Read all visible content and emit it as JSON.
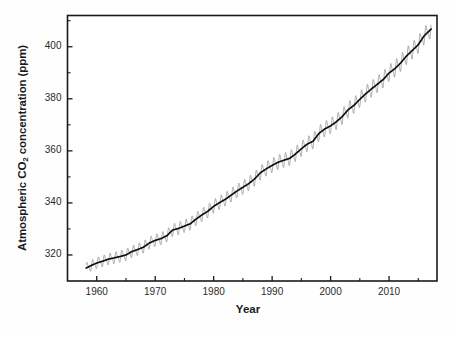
{
  "chart_data": {
    "type": "line",
    "title": "",
    "xlabel": "Year",
    "ylabel": "Atmospheric CO2 concentration (ppm)",
    "ylabel_parts": {
      "pre": "Atmospheric CO",
      "sub": "2",
      "post": " concentration (ppm)"
    },
    "xlim": [
      1955.0,
      2018.2
    ],
    "ylim": [
      310.0,
      412.0
    ],
    "grid": false,
    "legend": null,
    "xticks": [
      1960,
      1970,
      1980,
      1990,
      2000,
      2010
    ],
    "xtick_labels": [
      "1960",
      "1970",
      "1980",
      "1990",
      "2000",
      "2010"
    ],
    "xminor_ticks": [
      1965,
      1975,
      1985,
      1995,
      2005,
      2015
    ],
    "yticks": [
      320,
      340,
      360,
      380,
      400
    ],
    "ytick_labels": [
      "320",
      "340",
      "360",
      "380",
      "400"
    ],
    "yminor_ticks": [
      330,
      350,
      370,
      390,
      410
    ],
    "series": [
      {
        "name": "Annual mean trend",
        "color": "#101010",
        "linewidth": 1.7,
        "x": [
          1958.2,
          1959,
          1960,
          1961,
          1962,
          1963,
          1964,
          1965,
          1966,
          1967,
          1968,
          1969,
          1970,
          1971,
          1972,
          1973,
          1974,
          1975,
          1976,
          1977,
          1978,
          1979,
          1980,
          1981,
          1982,
          1983,
          1984,
          1985,
          1986,
          1987,
          1988,
          1989,
          1990,
          1991,
          1992,
          1993,
          1994,
          1995,
          1996,
          1997,
          1998,
          1999,
          2000,
          2001,
          2002,
          2003,
          2004,
          2005,
          2006,
          2007,
          2008,
          2009,
          2010,
          2011,
          2012,
          2013,
          2014,
          2015,
          2016,
          2017.2
        ],
        "values": [
          315.0,
          315.9,
          316.9,
          317.6,
          318.4,
          318.9,
          319.4,
          320.0,
          321.3,
          322.1,
          323.0,
          324.6,
          325.6,
          326.3,
          327.4,
          329.6,
          330.2,
          331.1,
          332.0,
          333.8,
          335.4,
          336.8,
          338.7,
          340.1,
          341.4,
          343.0,
          344.6,
          346.0,
          347.4,
          349.2,
          351.6,
          353.1,
          354.4,
          355.6,
          356.4,
          357.1,
          358.8,
          360.8,
          362.6,
          363.7,
          366.7,
          368.4,
          369.6,
          371.2,
          373.2,
          375.8,
          377.5,
          379.8,
          381.9,
          383.8,
          385.6,
          387.4,
          389.9,
          391.6,
          393.8,
          396.5,
          398.6,
          400.8,
          404.2,
          406.8
        ]
      },
      {
        "name": "Monthly seasonal oscillation",
        "color": "#8a8a8a",
        "linewidth": 0.7,
        "amplitude_ppm": 3.1,
        "period_years": 1.0,
        "description": "Sawtooth seasonal cycle superimposed on the annual trend, peaking in May and troughing in September"
      }
    ],
    "source_label": "Mauna Loa CO2 record"
  },
  "axes": {
    "frame_color": "#1a1a1a",
    "frame_width": 1.6,
    "background": "#ffffff",
    "tick_color": "#1a1a1a"
  }
}
